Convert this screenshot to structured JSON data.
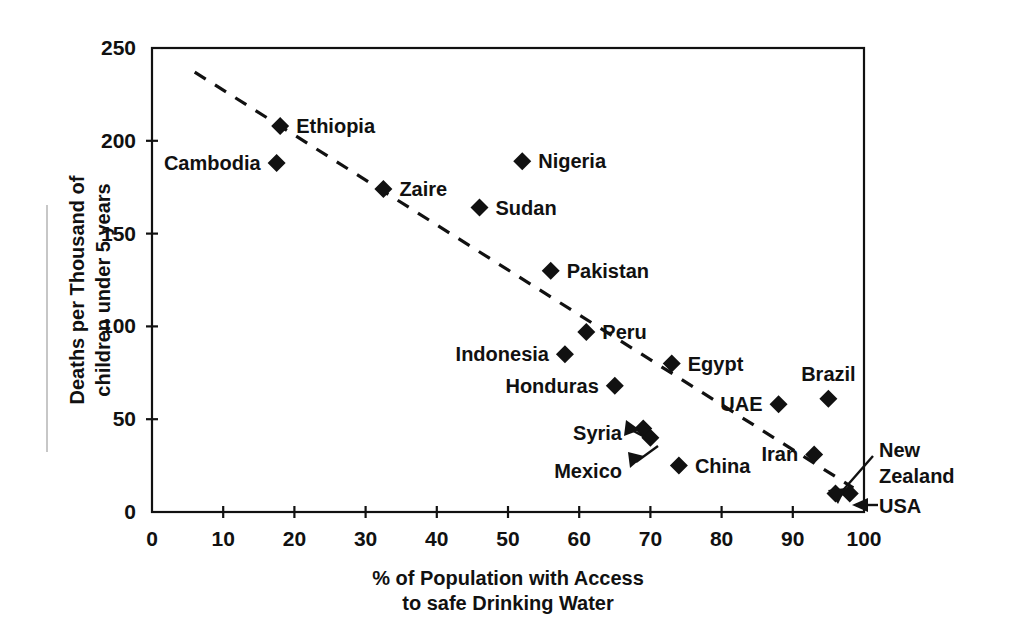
{
  "chart_data": {
    "type": "scatter",
    "title": "",
    "xlabel": "% of Population with Access to safe Drinking Water",
    "ylabel": "Deaths per Thousand of children under 5 years",
    "xlim": [
      0,
      100
    ],
    "ylim": [
      0,
      250
    ],
    "xticks": [
      0,
      10,
      20,
      30,
      40,
      50,
      60,
      70,
      80,
      90,
      100
    ],
    "yticks": [
      0,
      50,
      100,
      150,
      200,
      250
    ],
    "xtick_labels": [
      "0",
      "10",
      "20",
      "30",
      "40",
      "50",
      "60",
      "70",
      "80",
      "90",
      "100"
    ],
    "ytick_labels": [
      "0",
      "50",
      "100",
      "150",
      "200",
      "250"
    ],
    "grid": false,
    "legend": "none",
    "marker_shape": "diamond",
    "points": [
      {
        "label": "Ethiopia",
        "x": 18,
        "y": 208,
        "label_side": "right",
        "leader": false
      },
      {
        "label": "Cambodia",
        "x": 17.5,
        "y": 188,
        "label_side": "left",
        "leader": false
      },
      {
        "label": "Nigeria",
        "x": 52,
        "y": 189,
        "label_side": "right",
        "leader": false
      },
      {
        "label": "Zaire",
        "x": 32.5,
        "y": 174,
        "label_side": "right",
        "leader": false
      },
      {
        "label": "Sudan",
        "x": 46,
        "y": 164,
        "label_side": "right",
        "leader": false
      },
      {
        "label": "Pakistan",
        "x": 56,
        "y": 130,
        "label_side": "right",
        "leader": false
      },
      {
        "label": "Peru",
        "x": 61,
        "y": 97,
        "label_side": "right",
        "leader": false
      },
      {
        "label": "Indonesia",
        "x": 58,
        "y": 85,
        "label_side": "left",
        "leader": false
      },
      {
        "label": "Egypt",
        "x": 73,
        "y": 80,
        "label_side": "right",
        "leader": false
      },
      {
        "label": "Honduras",
        "x": 65,
        "y": 68,
        "label_side": "left",
        "leader": false
      },
      {
        "label": "Brazil",
        "x": 95,
        "y": 61,
        "label_side": "above",
        "leader": false
      },
      {
        "label": "UAE",
        "x": 88,
        "y": 58,
        "label_side": "left",
        "leader": false
      },
      {
        "label": "Syria",
        "x": 69,
        "y": 45,
        "label_side": "left",
        "leader": true
      },
      {
        "label": "Mexico",
        "x": 70,
        "y": 40,
        "label_side": "left",
        "leader": true
      },
      {
        "label": "Iran",
        "x": 93,
        "y": 31,
        "label_side": "left",
        "leader": false
      },
      {
        "label": "China",
        "x": 74,
        "y": 25,
        "label_side": "right",
        "leader": false
      },
      {
        "label": "New Zealand",
        "x": 96,
        "y": 10,
        "label_side": "right",
        "leader": true
      },
      {
        "label": "USA",
        "x": 98,
        "y": 10,
        "label_side": "right",
        "leader": true
      }
    ],
    "trendline": {
      "type": "dashed-linear",
      "x_start": 6,
      "y_start": 237,
      "x_end": 98.5,
      "y_end": 13
    }
  },
  "axes": {
    "y_title_line1": "Deaths per Thousand of",
    "y_title_line2": "children under 5 years",
    "x_title_line1": "% of Population with Access",
    "x_title_line2": "to safe Drinking Water"
  },
  "labels": {
    "new_zealand_line1": "New",
    "new_zealand_line2": "Zealand",
    "usa": "USA"
  },
  "colors": {
    "ink": "#111111",
    "background": "#ffffff",
    "rule": "#b9b9b9"
  }
}
